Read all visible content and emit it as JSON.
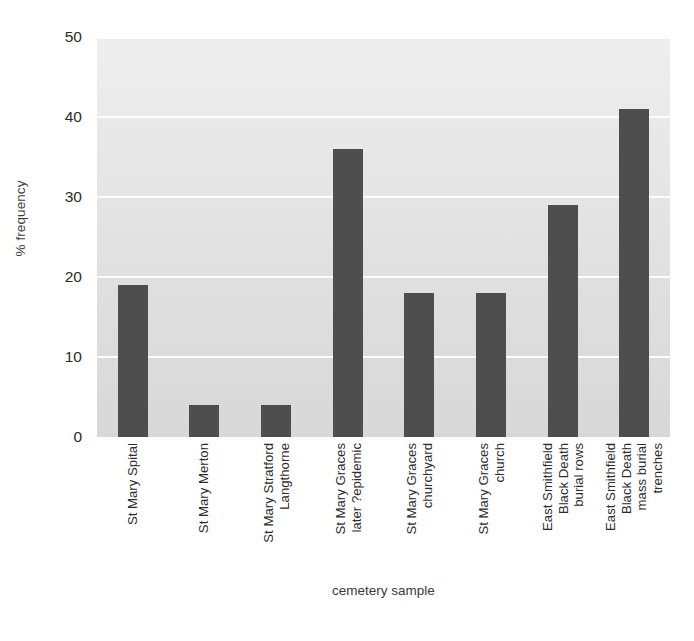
{
  "chart_data": {
    "type": "bar",
    "title": "",
    "xlabel": "cemetery sample",
    "ylabel": "% frequency",
    "ylim": [
      0,
      50
    ],
    "yticks": [
      0,
      10,
      20,
      30,
      40,
      50
    ],
    "grid": true,
    "legend": "none",
    "bar_color": "#4e4e4e",
    "plot_background": "#e3e3e3",
    "gridline_color": "#fdfdfd",
    "categories": [
      "St Mary Spital",
      "St Mary Merton",
      "St Mary Stratford\nLangthorne",
      "St Mary Graces\nlater ?epidemic",
      "St Mary Graces\nchurchyard",
      "St Mary Graces\nchurch",
      "East Smithfield\nBlack Death\nburial rows",
      "East Smithfield\nBlack Death\nmass burial\ntrenches"
    ],
    "values": [
      19,
      4,
      4,
      36,
      18,
      18,
      29,
      41
    ]
  }
}
